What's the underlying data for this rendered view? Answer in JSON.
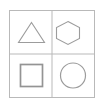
{
  "canvas": {
    "width": 103,
    "height": 109,
    "background_color": "#ffffff"
  },
  "figure": {
    "frame": {
      "name": "outer-frame",
      "x": 9.5,
      "y": 10.5,
      "width": 85,
      "height": 87,
      "stroke_color": "#b9b9b9",
      "stroke_width": 1,
      "fill_color": "#ffffff"
    },
    "dividers": {
      "stroke_color": "#b9b9b9",
      "stroke_width": 1,
      "vertical_x": 52,
      "horizontal_y": 54
    },
    "cells": [
      {
        "name": "cell-top-left",
        "shape": "triangle",
        "label": "Triangle",
        "stroke_color": "#9c9c9c",
        "stroke_width": 1.1,
        "fill": "none",
        "points": "31.5,22.5 44.5,42.5 18.5,42.5"
      },
      {
        "name": "cell-top-right",
        "shape": "hexagon",
        "label": "Hexagon",
        "stroke_color": "#9c9c9c",
        "stroke_width": 1.1,
        "fill": "none",
        "points": "68,21.5 79.5,27.5 79.5,38.5 68,44.5 56.5,38.5 56.5,27.5"
      },
      {
        "name": "cell-bottom-left",
        "shape": "square",
        "label": "Square",
        "stroke_color": "#949494",
        "stroke_width": 1.7,
        "fill": "none",
        "x": 20.5,
        "y": 64.5,
        "width": 22,
        "height": 22
      },
      {
        "name": "cell-bottom-right",
        "shape": "circle",
        "label": "Circle",
        "stroke_color": "#9c9c9c",
        "stroke_width": 1.2,
        "fill": "none",
        "cx": 73,
        "cy": 75.5,
        "r": 12.5
      }
    ]
  }
}
